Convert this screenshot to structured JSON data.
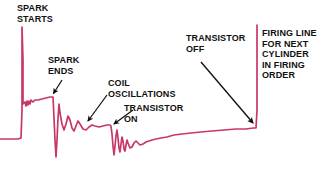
{
  "figure": {
    "kind": "ignition-secondary-oscilloscope-trace",
    "background_color": "#ffffff",
    "trace_color": "#c8376b",
    "arrow_color": "#101010",
    "label_color": "#101010"
  },
  "labels": {
    "spark_starts": "SPARK\nSTARTS",
    "spark_ends": "SPARK\nENDS",
    "coil_oscillations": "COIL\nOSCILLATIONS",
    "transistor_on": "TRANSISTOR\nON",
    "transistor_off": "TRANSISTOR\nOFF",
    "firing_line": "FIRING LINE\nFOR NEXT\nCYLINDER\nIN FIRING\nORDER"
  },
  "chart_data": {
    "type": "line",
    "title": "",
    "xlabel": "",
    "ylabel": "",
    "grid": false,
    "legend_position": "none",
    "xlim": [
      0,
      324
    ],
    "ylim": [
      174,
      0
    ],
    "series": [
      {
        "name": "secondary-ignition-waveform",
        "color": "#c8376b",
        "points": [
          [
            0,
            139
          ],
          [
            12,
            139
          ],
          [
            18,
            139
          ],
          [
            21,
            138
          ],
          [
            22,
            110
          ],
          [
            22,
            60
          ],
          [
            22,
            27
          ],
          [
            23,
            60
          ],
          [
            23,
            100
          ],
          [
            23,
            104
          ],
          [
            25,
            102
          ],
          [
            26,
            106
          ],
          [
            27,
            101
          ],
          [
            28,
            105
          ],
          [
            29,
            101
          ],
          [
            30,
            104
          ],
          [
            31,
            100
          ],
          [
            33,
            102
          ],
          [
            35,
            100
          ],
          [
            38,
            100
          ],
          [
            42,
            99
          ],
          [
            46,
            98
          ],
          [
            50,
            97
          ],
          [
            53,
            97
          ],
          [
            54,
            118
          ],
          [
            55,
            140
          ],
          [
            56,
            157
          ],
          [
            57,
            140
          ],
          [
            58,
            118
          ],
          [
            59,
            104
          ],
          [
            60,
            113
          ],
          [
            62,
            124
          ],
          [
            64,
            130
          ],
          [
            66,
            124
          ],
          [
            68,
            116
          ],
          [
            70,
            120
          ],
          [
            72,
            128
          ],
          [
            74,
            131
          ],
          [
            76,
            126
          ],
          [
            78,
            121
          ],
          [
            80,
            124
          ],
          [
            83,
            129
          ],
          [
            86,
            130
          ],
          [
            89,
            127
          ],
          [
            92,
            125
          ],
          [
            95,
            126
          ],
          [
            99,
            127
          ],
          [
            103,
            126
          ],
          [
            107,
            125
          ],
          [
            110,
            125
          ],
          [
            111,
            126
          ],
          [
            112,
            134
          ],
          [
            113,
            146
          ],
          [
            114,
            155
          ],
          [
            115,
            146
          ],
          [
            116,
            136
          ],
          [
            117,
            130
          ],
          [
            118,
            138
          ],
          [
            119,
            148
          ],
          [
            120,
            152
          ],
          [
            121,
            144
          ],
          [
            122,
            137
          ],
          [
            123,
            141
          ],
          [
            124,
            149
          ],
          [
            125,
            151
          ],
          [
            126,
            145
          ],
          [
            127,
            140
          ],
          [
            128,
            143
          ],
          [
            130,
            148
          ],
          [
            132,
            147
          ],
          [
            134,
            143
          ],
          [
            136,
            141
          ],
          [
            138,
            143
          ],
          [
            140,
            145
          ],
          [
            143,
            144
          ],
          [
            146,
            142
          ],
          [
            149,
            141
          ],
          [
            152,
            140
          ],
          [
            156,
            139
          ],
          [
            161,
            138
          ],
          [
            167,
            137
          ],
          [
            174,
            135
          ],
          [
            182,
            134
          ],
          [
            191,
            133
          ],
          [
            201,
            132
          ],
          [
            212,
            131
          ],
          [
            224,
            130
          ],
          [
            236,
            129
          ],
          [
            246,
            129
          ],
          [
            253,
            128
          ],
          [
            256,
            128
          ],
          [
            257,
            110
          ],
          [
            257,
            70
          ],
          [
            257,
            40
          ],
          [
            257,
            25
          ]
        ]
      }
    ],
    "annotations": [
      {
        "name": "spark-starts",
        "text": "SPARK STARTS",
        "target_x": 22,
        "target_y": 40,
        "pointer": "implicit-above-line"
      },
      {
        "name": "spark-ends",
        "text": "SPARK ENDS",
        "target_x": 52,
        "target_y": 96,
        "arrow": [
          [
            62,
            80
          ],
          [
            52,
            95
          ]
        ]
      },
      {
        "name": "coil-oscillations",
        "text": "COIL OSCILLATIONS",
        "target_x": 86,
        "target_y": 126,
        "arrow": [
          [
            106,
            96
          ],
          [
            86,
            124
          ]
        ]
      },
      {
        "name": "transistor-on",
        "text": "TRANSISTOR ON",
        "target_x": 112,
        "target_y": 128,
        "arrow": [
          [
            132,
            110
          ],
          [
            112,
            127
          ]
        ]
      },
      {
        "name": "transistor-off",
        "text": "TRANSISTOR OFF",
        "target_x": 256,
        "target_y": 128,
        "arrow": [
          [
            200,
            62
          ],
          [
            255,
            126
          ]
        ]
      },
      {
        "name": "firing-line",
        "text": "FIRING LINE FOR NEXT CYLINDER IN FIRING ORDER",
        "target_x": 257,
        "target_y": 60,
        "pointer": "adjacent-right-of-line"
      }
    ]
  }
}
